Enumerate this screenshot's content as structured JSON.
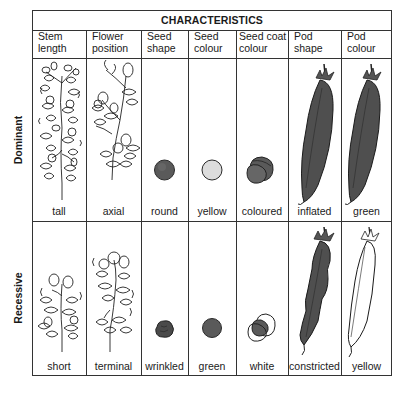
{
  "title": "CHARACTERISTICS",
  "columns": [
    {
      "label_line1": "Stem",
      "label_line2": "length"
    },
    {
      "label_line1": "Flower",
      "label_line2": "position"
    },
    {
      "label_line1": "Seed",
      "label_line2": "shape"
    },
    {
      "label_line1": "Seed",
      "label_line2": "colour"
    },
    {
      "label_line1": "Seed coat",
      "label_line2": "colour"
    },
    {
      "label_line1": "Pod",
      "label_line2": "shape"
    },
    {
      "label_line1": "Pod",
      "label_line2": "colour"
    }
  ],
  "rows": [
    {
      "label": "Dominant",
      "traits": [
        "tall",
        "axial",
        "round",
        "yellow",
        "coloured",
        "inflated",
        "green"
      ],
      "illustrations": [
        "tall-pea-plant",
        "axial-flowering-plant",
        "round-seed",
        "yellow-seed",
        "coloured-seed-coat",
        "inflated-pod",
        "green-pod"
      ]
    },
    {
      "label": "Recessive",
      "traits": [
        "short",
        "terminal",
        "wrinkled",
        "green",
        "white",
        "constricted",
        "yellow"
      ],
      "illustrations": [
        "short-pea-plant",
        "terminal-flowering-plant",
        "wrinkled-seed",
        "green-seed",
        "white-seed-coat",
        "constricted-pod",
        "yellow-pod"
      ]
    }
  ],
  "colors": {
    "line": "#333333",
    "dark_fill": "#555555",
    "light_fill": "#dcdcdc",
    "background": "#ffffff"
  }
}
